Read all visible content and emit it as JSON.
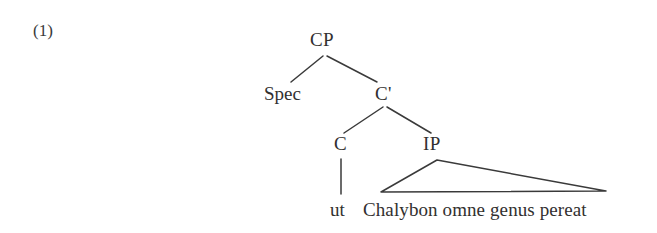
{
  "example": {
    "number_label": "(1)"
  },
  "tree": {
    "type": "x-bar-syntax-tree",
    "nodes": {
      "root": "CP",
      "specifier": "Spec",
      "cbar": "C'",
      "head_c": "C",
      "complement": "IP"
    },
    "terminals": {
      "head_terminal": "ut",
      "triangle_phrase": "Chalybon omne genus pereat"
    },
    "edges": [
      {
        "from": "CP",
        "to": "Spec"
      },
      {
        "from": "CP",
        "to": "C'"
      },
      {
        "from": "C'",
        "to": "C"
      },
      {
        "from": "C'",
        "to": "IP"
      },
      {
        "from": "C",
        "to": "ut"
      },
      {
        "from": "IP",
        "to": "Chalybon omne genus pereat"
      }
    ],
    "line_color": "#3a3a3a",
    "text_color": "#32302f",
    "background_color": "#ffffff"
  }
}
